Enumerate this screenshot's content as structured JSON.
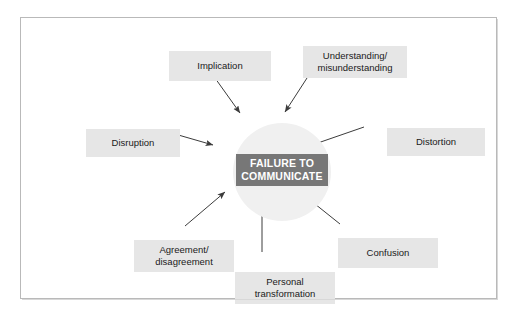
{
  "diagram": {
    "hub": {
      "label": "FAILURE TO\nCOMMUNICATE",
      "shape": "circle",
      "fill_color": "#f0f0f0",
      "label_box_color": "#777777",
      "label_text_color": "#ffffff"
    },
    "frame": {
      "border_color": "#b9b9b9",
      "background": "#ffffff"
    },
    "node_style": {
      "fill_color": "#e6e6e6",
      "text_color": "#1a1a1a"
    },
    "arrow_color": "#3c3c3c",
    "nodes": [
      {
        "id": "implication",
        "label": "Implication",
        "position": "top-left",
        "arrow_direction": "down-right"
      },
      {
        "id": "understanding",
        "label": "Understanding/\nmisunderstanding",
        "position": "top-right",
        "arrow_direction": "down-left"
      },
      {
        "id": "disruption",
        "label": "Disruption",
        "position": "left",
        "arrow_direction": "right"
      },
      {
        "id": "distortion",
        "label": "Distortion",
        "position": "right",
        "arrow_direction": "left"
      },
      {
        "id": "agreement",
        "label": "Agreement/\ndisagreement",
        "position": "bottom-left",
        "arrow_direction": "up-right"
      },
      {
        "id": "personal",
        "label": "Personal\ntransformation",
        "position": "bottom",
        "arrow_direction": "up"
      },
      {
        "id": "confusion",
        "label": "Confusion",
        "position": "bottom-right",
        "arrow_direction": "up-left"
      }
    ]
  }
}
